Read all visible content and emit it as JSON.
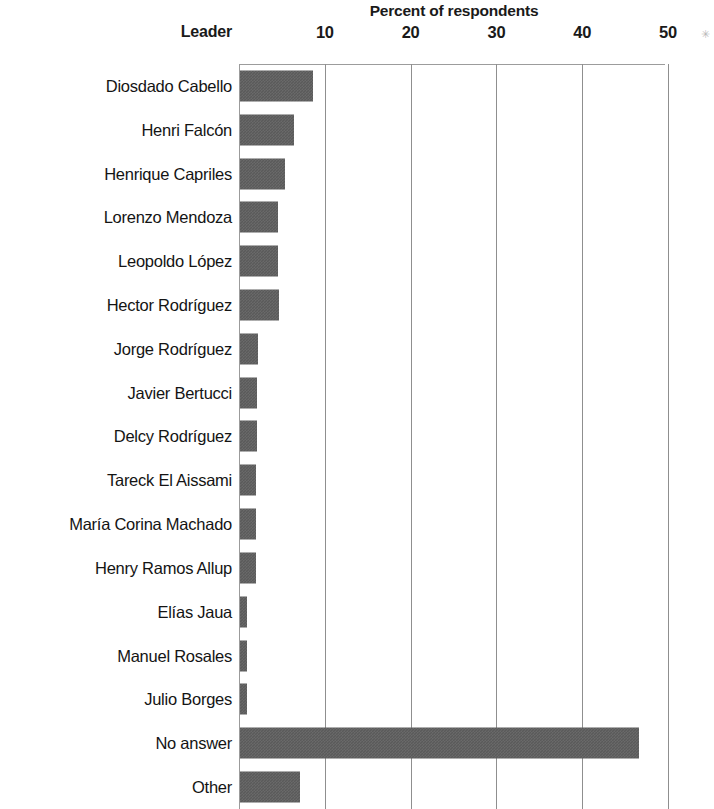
{
  "chart": {
    "axis_title": "Percent of respondents",
    "category_header": "Leader",
    "decor": "✳"
  },
  "chart_data": {
    "type": "bar",
    "orientation": "horizontal",
    "title": "Percent of respondents",
    "xlabel": "Percent of respondents",
    "ylabel": "Leader",
    "xlim": [
      0,
      52
    ],
    "xticks": [
      10,
      20,
      30,
      40,
      50
    ],
    "xtick_labels": [
      "10",
      "20",
      "30",
      "40",
      "50"
    ],
    "grid": "vertical",
    "legend": "none",
    "bar_color": "#5a5a5a",
    "categories": [
      "Diosdado Cabello",
      "Henri Falcón",
      "Henrique Capriles",
      "Lorenzo Mendoza",
      "Leopoldo López",
      "Hector Rodríguez",
      "Jorge Rodríguez",
      "Javier Bertucci",
      "Delcy Rodríguez",
      "Tareck El Aissami",
      "María Corina Machado",
      "Henry Ramos Allup",
      "Elías Jaua",
      "Manuel Rosales",
      "Julio Borges",
      "No answer",
      "Other"
    ],
    "values": [
      8.5,
      6.3,
      5.3,
      4.4,
      4.4,
      4.5,
      2.1,
      2.0,
      2.0,
      1.9,
      1.9,
      1.9,
      0.8,
      0.8,
      0.8,
      46.5,
      7.0
    ]
  }
}
